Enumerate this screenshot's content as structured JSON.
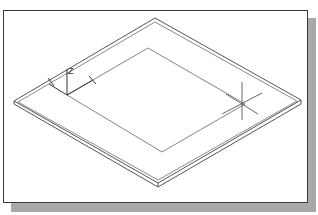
{
  "figure": {
    "type": "cad-isometric-view",
    "colors": {
      "background": "#ffffff",
      "frame_border": "#3a3a3a",
      "shadow": "#a8a8a8",
      "plate_edge": "#555555",
      "inner_outline": "#777777",
      "ucs_icon": "#333333"
    }
  },
  "ucs_icon": {
    "z_label": "Z"
  },
  "plate": {
    "outer_vertices": {
      "top": [
        155,
        18
      ],
      "right": [
        301,
        100
      ],
      "bottom": [
        158,
        183
      ],
      "left": [
        14,
        101
      ]
    },
    "inner_vertices": {
      "top": [
        148,
        48
      ],
      "right": [
        245,
        104
      ],
      "bottom": [
        162,
        152
      ],
      "left": [
        67,
        95
      ]
    }
  },
  "crosshair": {
    "center": [
      242,
      104
    ]
  }
}
